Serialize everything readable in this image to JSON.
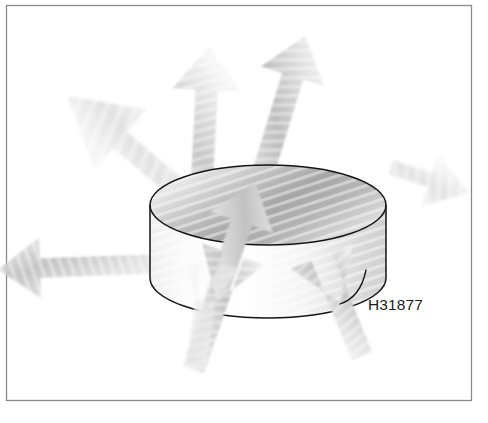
{
  "figure": {
    "part_number": "H31877",
    "background_color": "#ffffff",
    "frame_border_color": "#8a8a8e",
    "outline_color": "#1a1a1a",
    "label_color": "#1c1c1c",
    "arrow_light": "#f2f2f2",
    "arrow_mid": "#c9c9c9",
    "arrow_dark": "#9a9a9a",
    "disc_top_light": "#f6f6f6",
    "disc_top_dark": "#9d9d9d",
    "disc_side_light": "#fcfcfc",
    "disc_side_dark": "#c6c6c6"
  },
  "frame": {
    "name": "figure-border",
    "x": 6,
    "y": 5,
    "width": 466,
    "height": 396
  },
  "disc": {
    "name": "cylinder-disc",
    "center_x": 268,
    "top_center_y": 205,
    "radius_x": 118,
    "radius_y": 40,
    "height": 73
  },
  "label": {
    "text": "H31877",
    "x": 368,
    "y": 306,
    "leader_start_x": 340,
    "leader_start_y": 303,
    "leader_end_x": 363,
    "leader_end_y": 272
  },
  "arrows": [
    {
      "name": "arrow-up",
      "direction": "up",
      "angle_deg": 0,
      "tip_x": 205,
      "tip_y": 40,
      "tail_x": 212,
      "tail_y": 200
    },
    {
      "name": "arrow-up-right",
      "direction": "up-right",
      "angle_deg": 18,
      "tip_x": 310,
      "tip_y": 22,
      "tail_x": 283,
      "tail_y": 168
    },
    {
      "name": "arrow-up-left",
      "direction": "up-left",
      "angle_deg": -52,
      "tip_x": 72,
      "tip_y": 102,
      "tail_x": 168,
      "tail_y": 178
    },
    {
      "name": "arrow-left",
      "direction": "left",
      "angle_deg": -90,
      "tip_x": 22,
      "tip_y": 268,
      "tail_x": 160,
      "tail_y": 256
    },
    {
      "name": "arrow-right",
      "direction": "right",
      "angle_deg": 90,
      "tip_x": 466,
      "tip_y": 172,
      "tail_x": 384,
      "tail_y": 190
    },
    {
      "name": "arrow-down-left",
      "direction": "down-left",
      "angle_deg": -160,
      "tip_x": 152,
      "tip_y": 398,
      "tail_x": 228,
      "tail_y": 282
    },
    {
      "name": "arrow-down-right",
      "direction": "down-right",
      "angle_deg": 160,
      "tip_x": 380,
      "tip_y": 382,
      "tail_x": 326,
      "tail_y": 276
    },
    {
      "name": "arrow-down-center",
      "direction": "down",
      "angle_deg": 185,
      "tip_x": 196,
      "tip_y": 372,
      "tail_x": 222,
      "tail_y": 292
    }
  ]
}
